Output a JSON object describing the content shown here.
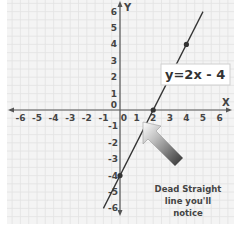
{
  "chart_data": {
    "type": "line",
    "title": "",
    "xlabel": "X",
    "ylabel": "Y",
    "xlim": [
      -6,
      6
    ],
    "ylim": [
      -6,
      6
    ],
    "grid": true,
    "x_ticks": [
      "-6",
      "-5",
      "-4",
      "-3",
      "-2",
      "-1",
      "0",
      "1",
      "2",
      "3",
      "4",
      "5",
      "6"
    ],
    "y_ticks_positive": [
      "6",
      "5",
      "4",
      "3",
      "2",
      "1",
      "0"
    ],
    "y_ticks_negative": [
      "-1",
      "-2",
      "-3",
      "-4",
      "-5",
      "-6"
    ],
    "series": [
      {
        "name": "y=2x - 4",
        "slope": 2,
        "intercept": -4,
        "x_range": [
          -1,
          5
        ],
        "marked_points": [
          {
            "x": 0,
            "y": -4
          },
          {
            "x": 2,
            "y": 0
          },
          {
            "x": 4,
            "y": 4
          }
        ]
      }
    ],
    "annotations": {
      "equation_label": "y=2x - 4",
      "note_lines": [
        "Dead Straight",
        "line you'll",
        "notice"
      ]
    },
    "colors": {
      "line": "#333333",
      "grid": "#e2e2e2",
      "background": "#f4f4f4",
      "arrow_dark": "#3a3a3a",
      "arrow_light": "#ffffff"
    }
  }
}
